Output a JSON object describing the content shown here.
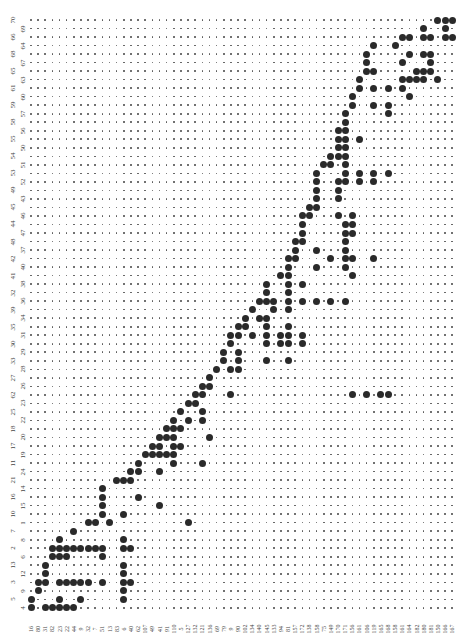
{
  "chart_data": {
    "type": "table",
    "title": "",
    "grid": {
      "rows": 70,
      "cols": 60,
      "x0": 31,
      "dx": 7.14,
      "y0": 20,
      "dy": 8.52,
      "small_dot_color": "#555555",
      "large_dot_color": "#2a2a2a"
    },
    "row_labels": [
      "70",
      "69",
      "66",
      "64",
      "68",
      "67",
      "65",
      "63",
      "61",
      "60",
      "59",
      "57",
      "58",
      "56",
      "55",
      "50",
      "54",
      "51",
      "53",
      "52",
      "49",
      "43",
      "45",
      "46",
      "44",
      "47",
      "48",
      "37",
      "42",
      "40",
      "41",
      "38",
      "32",
      "36",
      "39",
      "34",
      "35",
      "31",
      "30",
      "29",
      "33",
      "28",
      "27",
      "26",
      "62",
      "23",
      "25",
      "22",
      "18",
      "20",
      "17",
      "19",
      "11",
      "24",
      "21",
      "14",
      "16",
      "15",
      "10",
      "1",
      "7",
      "8",
      "2",
      "6",
      "13",
      "12",
      "3",
      "9",
      "5",
      "4"
    ],
    "col_labels": [
      "16",
      "80",
      "31",
      "82",
      "23",
      "22",
      "44",
      "9",
      "32",
      "7",
      "51",
      "13",
      "83",
      "6",
      "40",
      "62",
      "107",
      "49",
      "41",
      "91",
      "110",
      "5",
      "127",
      "132",
      "121",
      "136",
      "69",
      "79",
      "9",
      "90",
      "102",
      "134",
      "140",
      "145",
      "133",
      "94",
      "81",
      "157",
      "172",
      "138",
      "158",
      "75",
      "149",
      "170",
      "171",
      "156",
      "161",
      "106",
      "119",
      "165",
      "168",
      "158",
      "161",
      "164",
      "182",
      "180",
      "181",
      "150",
      "166",
      "167"
    ],
    "presence": [
      [
        57,
        58,
        59
      ],
      [
        55,
        58
      ],
      [
        52,
        53,
        55,
        56,
        58,
        59
      ],
      [
        48,
        51
      ],
      [
        47,
        53,
        55,
        56
      ],
      [
        47,
        52,
        56
      ],
      [
        47,
        48,
        54,
        55,
        56
      ],
      [
        46,
        52,
        53,
        54,
        55,
        57
      ],
      [
        46,
        48,
        50,
        52
      ],
      [
        45,
        53
      ],
      [
        45,
        48,
        50
      ],
      [
        44,
        50
      ],
      [
        44
      ],
      [
        43,
        44
      ],
      [
        43,
        44,
        46
      ],
      [
        43,
        44
      ],
      [
        42,
        43,
        44
      ],
      [
        41,
        42,
        44
      ],
      [
        40,
        44,
        46,
        48,
        50
      ],
      [
        40,
        43,
        44,
        46,
        48
      ],
      [
        40,
        43
      ],
      [
        40,
        43
      ],
      [
        39,
        40
      ],
      [
        38,
        39,
        43,
        45
      ],
      [
        38,
        44,
        45
      ],
      [
        38,
        44,
        45
      ],
      [
        37,
        38,
        44
      ],
      [
        37,
        40,
        44
      ],
      [
        36,
        37,
        42,
        44,
        45,
        48
      ],
      [
        36,
        40,
        44
      ],
      [
        35,
        36,
        45
      ],
      [
        33,
        36,
        38
      ],
      [
        33,
        36
      ],
      [
        32,
        33,
        34,
        36,
        38,
        40,
        42,
        44
      ],
      [
        31,
        34,
        36
      ],
      [
        30,
        32,
        33
      ],
      [
        29,
        30,
        33,
        36
      ],
      [
        28,
        29,
        31,
        33,
        35,
        36,
        38
      ],
      [
        28,
        33,
        35,
        36,
        38
      ],
      [
        27,
        29
      ],
      [
        27,
        29,
        33,
        36
      ],
      [
        26,
        28,
        29
      ],
      [
        25
      ],
      [
        24,
        25
      ],
      [
        23,
        24,
        28,
        45,
        47,
        49,
        50
      ],
      [
        22,
        23
      ],
      [
        21,
        24
      ],
      [
        20,
        22,
        24
      ],
      [
        19,
        20,
        21
      ],
      [
        18,
        19,
        20,
        25
      ],
      [
        17,
        18,
        20,
        21
      ],
      [
        16,
        17,
        18,
        19,
        20
      ],
      [
        15,
        20,
        24
      ],
      [
        14,
        15,
        18
      ],
      [
        12,
        13,
        14
      ],
      [
        10
      ],
      [
        10,
        15
      ],
      [
        10,
        18
      ],
      [
        10,
        13
      ],
      [
        8,
        9,
        11,
        22
      ],
      [
        6
      ],
      [
        4,
        13
      ],
      [
        3,
        4,
        5,
        6,
        7,
        8,
        9,
        10,
        13,
        14
      ],
      [
        3,
        4,
        5,
        10
      ],
      [
        2,
        13
      ],
      [
        2,
        13
      ],
      [
        1,
        2,
        4,
        5,
        6,
        7,
        8,
        10,
        13,
        14
      ],
      [
        1,
        13
      ],
      [
        0,
        4,
        7,
        13
      ],
      [
        0,
        2,
        3,
        4,
        5,
        6
      ]
    ],
    "xlabel": "",
    "ylabel": "",
    "legend": []
  }
}
